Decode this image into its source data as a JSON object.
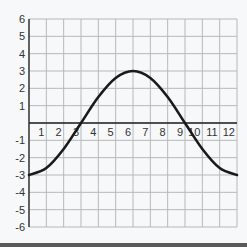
{
  "chart_data": {
    "type": "line",
    "title": "",
    "xlabel": "",
    "ylabel": "",
    "xlim": [
      0,
      12
    ],
    "ylim": [
      -6,
      6
    ],
    "grid": true,
    "x_ticks": [
      1,
      2,
      3,
      4,
      5,
      6,
      7,
      8,
      9,
      10,
      11,
      12
    ],
    "y_ticks": [
      6,
      5,
      4,
      3,
      2,
      1,
      -1,
      -2,
      -3,
      -4,
      -5,
      -6
    ],
    "series": [
      {
        "name": "y = -3cos(πx/6)",
        "color": "#1a1a1a",
        "x": [
          0,
          1,
          2,
          3,
          4,
          5,
          6,
          7,
          8,
          9,
          10,
          11,
          12
        ],
        "values": [
          -3,
          -2.6,
          -1.5,
          0,
          1.5,
          2.6,
          3,
          2.6,
          1.5,
          0,
          -1.5,
          -2.6,
          -3
        ]
      }
    ]
  },
  "colors": {
    "grid": "#b8b8b8",
    "axis": "#222222",
    "curve": "#1a1a1a",
    "background": "#f7f8fa"
  }
}
